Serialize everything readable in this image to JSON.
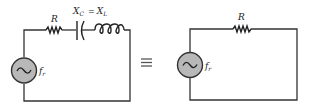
{
  "diagram": {
    "type": "series-resonance-equivalence",
    "left_circuit": {
      "components": [
        {
          "kind": "ac-source",
          "label_main": "f",
          "label_sub": "r"
        },
        {
          "kind": "resistor",
          "label": "R"
        },
        {
          "kind": "capacitor"
        },
        {
          "kind": "inductor"
        }
      ],
      "annotation": {
        "xc_main": "X",
        "xc_sub": "C",
        "equals": "=",
        "xl_main": "X",
        "xl_sub": "L"
      }
    },
    "equivalence_symbol": "≡",
    "right_circuit": {
      "components": [
        {
          "kind": "ac-source",
          "label_main": "f",
          "label_sub": "r"
        },
        {
          "kind": "resistor",
          "label": "R"
        }
      ]
    },
    "colors": {
      "wire": "#333333",
      "source_fill": "#b8b8b8",
      "background": "#ffffff"
    }
  }
}
